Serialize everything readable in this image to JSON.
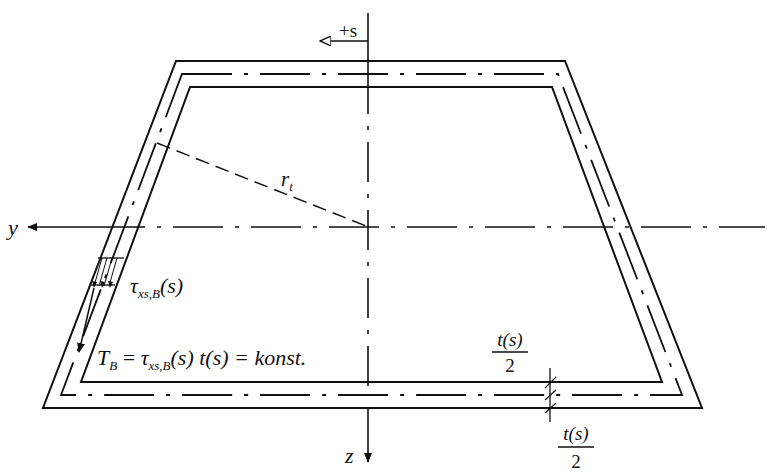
{
  "diagram": {
    "axes": {
      "y_label": "y",
      "z_label": "z",
      "s_label": "+s"
    },
    "labels": {
      "radius": "r",
      "radius_sub": "t",
      "shear_stress_tau": "τ",
      "shear_stress_sub": "xs,B",
      "shear_stress_arg": "(s)",
      "bredt_T": "T",
      "bredt_T_sub": "B",
      "bredt_eq": " = ",
      "bredt_tau": "τ",
      "bredt_tau_sub": "xs,B",
      "bredt_rest": "(s) t(s) = konst.",
      "half_thickness_top_num": "t(s)",
      "half_thickness_top_den": "2",
      "half_thickness_bottom_num": "t(s)",
      "half_thickness_bottom_den": "2"
    },
    "colors": {
      "line": "#111111",
      "background": "#ffffff"
    }
  }
}
